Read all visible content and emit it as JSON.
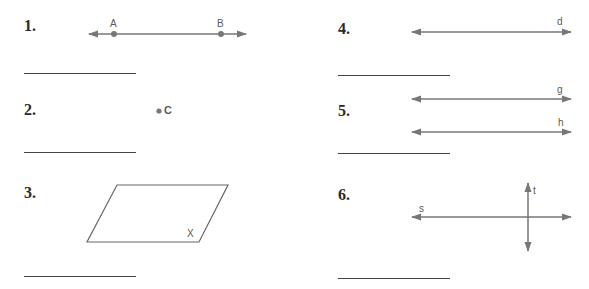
{
  "worksheet": {
    "problems": [
      {
        "number": "1.",
        "figure": "line",
        "labels": [
          "A",
          "B"
        ]
      },
      {
        "number": "2.",
        "figure": "point",
        "labels": [
          "C"
        ]
      },
      {
        "number": "3.",
        "figure": "plane",
        "labels": [
          "X"
        ]
      },
      {
        "number": "4.",
        "figure": "line",
        "labels": [
          "d"
        ]
      },
      {
        "number": "5.",
        "figure": "parallel-lines",
        "labels": [
          "g",
          "h"
        ]
      },
      {
        "number": "6.",
        "figure": "intersecting-lines",
        "labels": [
          "s",
          "t"
        ]
      }
    ],
    "colors": {
      "figure_stroke": "#777777",
      "label_text": "#5a5a5a",
      "number_text": "#2a2a2a",
      "answer_line": "#444444"
    }
  }
}
